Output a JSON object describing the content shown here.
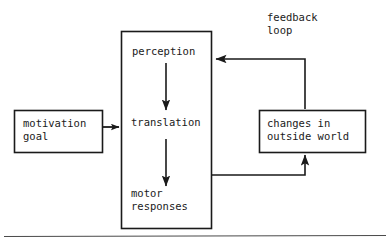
{
  "diagram": {
    "type": "flow-diagram",
    "title_text": "",
    "line_color": "#1a1a1a",
    "text_color": "#1a1a1a",
    "background": "#ffffff",
    "nodes": [
      {
        "id": "motivation",
        "name": "motivation-goal-box",
        "line1": "motivation",
        "line2": "goal",
        "x": 14,
        "y": 110,
        "w": 88,
        "h": 42
      },
      {
        "id": "central",
        "name": "central-process-box",
        "line1": "",
        "line2": "",
        "x": 121,
        "y": 31,
        "w": 90,
        "h": 197
      },
      {
        "id": "changes",
        "name": "changes-outside-world-box",
        "line1": "changes in",
        "line2": "outside world",
        "x": 259,
        "y": 110,
        "w": 106,
        "h": 42
      }
    ],
    "stage_labels": [
      {
        "id": "perception",
        "name": "perception-label",
        "text": "perception",
        "x": 132,
        "y": 46
      },
      {
        "id": "translation",
        "name": "translation-label",
        "text": "translation",
        "x": 131,
        "y": 117
      },
      {
        "id": "motor",
        "name": "motor-responses-label",
        "line1": "motor",
        "line2": "responses",
        "x": 131,
        "y": 188
      }
    ],
    "annotations": [
      {
        "id": "feedback",
        "name": "feedback-loop-label",
        "line1": "feedback",
        "line2": "loop",
        "x": 267,
        "y": 12
      }
    ],
    "edges": [
      {
        "id": "motivation-to-translation",
        "name": "arrow-motivation-to-central",
        "from": "motivation",
        "to": "central",
        "direction": "right"
      },
      {
        "id": "perception-to-translation",
        "name": "arrow-perception-to-translation",
        "from": "perception",
        "to": "translation",
        "direction": "down"
      },
      {
        "id": "translation-to-motor",
        "name": "arrow-translation-to-motor",
        "from": "translation",
        "to": "motor",
        "direction": "down"
      },
      {
        "id": "motor-to-changes",
        "name": "arrow-central-to-changes",
        "from": "central",
        "to": "changes",
        "direction": "up-right"
      },
      {
        "id": "changes-to-perception",
        "name": "arrow-changes-to-perception-feedback",
        "from": "changes",
        "to": "central",
        "direction": "up-left"
      }
    ],
    "footer_rule": {
      "name": "page-rule",
      "y": 236
    }
  }
}
